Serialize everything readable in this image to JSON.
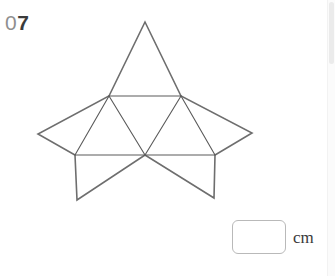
{
  "question": {
    "number_prefix": "0",
    "number_digits": "7",
    "number_full": "07"
  },
  "figure": {
    "name": "polyhedron-net-star",
    "stroke_color": "#6e6e6e",
    "inner_stroke_color": "#5a5a5a",
    "fill_color": "#ffffff",
    "stroke_width": 1.6,
    "inner_stroke_width": 1.1,
    "view_box": "0 0 335 276",
    "points": {
      "top_apex": [
        145,
        22
      ],
      "mid_left": [
        109,
        96
      ],
      "mid_right": [
        181,
        96
      ],
      "star_left": [
        38,
        134
      ],
      "star_right": [
        252,
        133
      ],
      "base_left": [
        75,
        155
      ],
      "base_center": [
        145,
        155
      ],
      "base_right": [
        215,
        155
      ],
      "flap_bottom_left": [
        77,
        200
      ],
      "flap_bottom_right": [
        214,
        198
      ]
    },
    "outline_path": "M 145 22 L 181 96 L 252 133 L 215 155 L 214 198 L 145 155 L 77 200 L 75 155 L 38 134 L 109 96 Z",
    "inner_segments": [
      {
        "name": "inner-edge-top-row",
        "from": [
          109,
          96
        ],
        "to": [
          181,
          96
        ]
      },
      {
        "name": "inner-edge-bottom-row",
        "from": [
          75,
          155
        ],
        "to": [
          215,
          155
        ]
      },
      {
        "name": "inner-edge-left-up",
        "from": [
          109,
          96
        ],
        "to": [
          75,
          155
        ]
      },
      {
        "name": "inner-edge-left-down",
        "from": [
          109,
          96
        ],
        "to": [
          145,
          155
        ]
      },
      {
        "name": "inner-edge-right-up",
        "from": [
          181,
          96
        ],
        "to": [
          145,
          155
        ]
      },
      {
        "name": "inner-edge-right-down",
        "from": [
          181,
          96
        ],
        "to": [
          215,
          155
        ]
      }
    ]
  },
  "answer": {
    "input_value": "",
    "input_placeholder": "",
    "unit_label": "cm"
  },
  "scrollbar": {
    "track_color": "#fbfbfb",
    "thumb_color": "#ebebeb"
  }
}
